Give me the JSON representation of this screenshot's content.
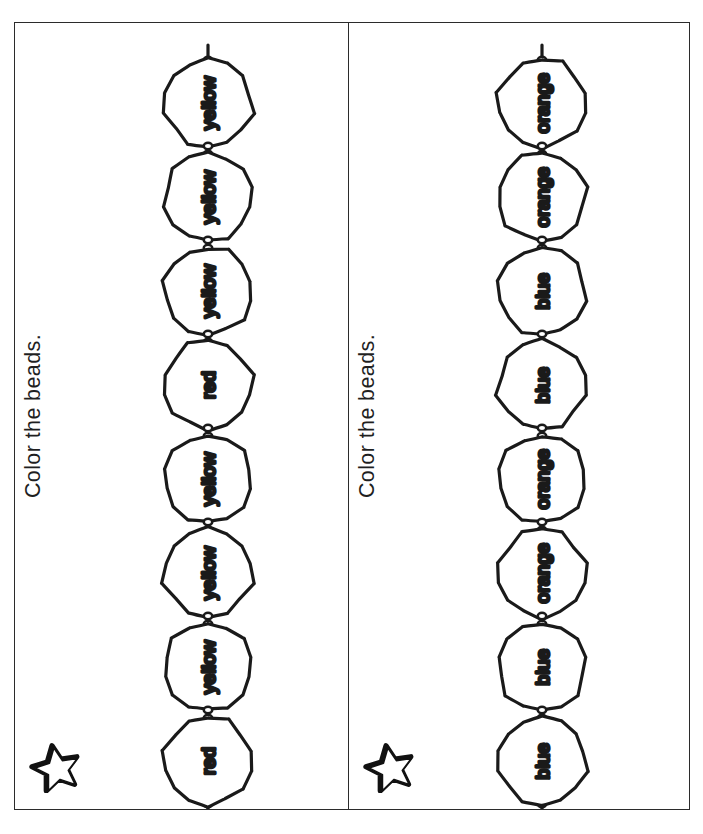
{
  "worksheet": {
    "background_color": "#ffffff",
    "ink_color": "#1f1f1f",
    "frame_border_color": "#2b2b2b"
  },
  "panels": [
    {
      "id": "panel-left",
      "title": "Color the beads.",
      "star_icon": "star-icon",
      "beads": [
        {
          "index": 1,
          "label": "yellow"
        },
        {
          "index": 2,
          "label": "yellow"
        },
        {
          "index": 3,
          "label": "yellow"
        },
        {
          "index": 4,
          "label": "red"
        },
        {
          "index": 5,
          "label": "yellow"
        },
        {
          "index": 6,
          "label": "yellow"
        },
        {
          "index": 7,
          "label": "yellow"
        },
        {
          "index": 8,
          "label": "red"
        }
      ]
    },
    {
      "id": "panel-right",
      "title": "Color the beads.",
      "star_icon": "star-icon",
      "beads": [
        {
          "index": 1,
          "label": "orange"
        },
        {
          "index": 2,
          "label": "orange"
        },
        {
          "index": 3,
          "label": "blue"
        },
        {
          "index": 4,
          "label": "blue"
        },
        {
          "index": 5,
          "label": "orange"
        },
        {
          "index": 6,
          "label": "orange"
        },
        {
          "index": 7,
          "label": "blue"
        },
        {
          "index": 8,
          "label": "blue"
        }
      ]
    }
  ]
}
